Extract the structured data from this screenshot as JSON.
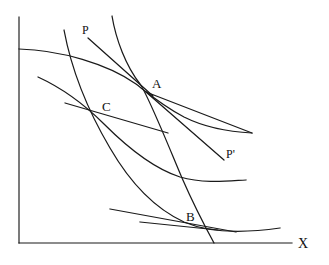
{
  "figure": {
    "type": "hand-drawn-economics-diagram",
    "title": "",
    "background_color": "#ffffff",
    "ink_color": "#1a1a1a",
    "width": 329,
    "height": 265
  },
  "axes": {
    "x_axis_label": "X",
    "y_axis_label": "",
    "x_axis": {
      "y": 243,
      "x_start": 19,
      "x_end": 292
    },
    "y_axis": {
      "x": 19,
      "y_start": 17,
      "y_end": 243
    }
  },
  "points": [
    {
      "name": "A",
      "label": "A",
      "x": 147,
      "y": 92,
      "label_x": 152,
      "label_y": 88
    },
    {
      "name": "C",
      "label": "C",
      "x": 100,
      "y": 114,
      "label_x": 102,
      "label_y": 111
    },
    {
      "name": "B",
      "label": "B",
      "x": 188,
      "y": 222,
      "label_x": 186,
      "label_y": 221
    }
  ],
  "curve_labels": [
    {
      "name": "P",
      "label": "P",
      "x": 82,
      "y": 34
    },
    {
      "name": "P-prime",
      "label": "P'",
      "x": 226,
      "y": 158
    }
  ],
  "curves": {
    "indifference_curve_upper": {
      "name": "indifference-curve-upper",
      "path": "M 19,49 C 60,50 108,64 136,84 C 144,90 160,104 184,117 C 206,128 232,132 252,133"
    },
    "indifference_curve_middle": {
      "name": "indifference-curve-middle",
      "path": "M 38,77 C 62,88 84,104 104,124 C 126,146 152,168 180,177 C 204,184 228,181 246,180"
    },
    "indifference_curve_lower": {
      "name": "indifference-curve-lower",
      "path": "M 64,30 C 70,62 84,104 110,148 C 132,186 158,210 184,222 C 214,235 252,232 280,228"
    },
    "price_offer_curve_through_A": {
      "name": "price-offer-curve-through-a",
      "path": "M 112,16 C 116,40 126,66 140,84 C 148,95 166,140 182,178 C 196,210 208,232 214,243"
    }
  },
  "budget_lines": {
    "budget_line_P_to_A": {
      "name": "budget-line-p-to-a",
      "path": "M 88,38 L 153,96"
    },
    "budget_line_A_to_Pprime": {
      "name": "budget-line-a-to-pprime",
      "path": "M 146,92 L 224,160"
    },
    "budget_line_through_C": {
      "name": "budget-line-through-c",
      "path": "M 65,103 L 168,133"
    },
    "budget_line_through_A_flat": {
      "name": "budget-line-through-a-flat",
      "path": "M 146,92 L 252,133"
    },
    "budget_line_through_B": {
      "name": "budget-line-through-b",
      "path": "M 110,209 L 236,232"
    },
    "budget_line_B_flat": {
      "name": "budget-line-b-flat",
      "path": "M 140,222 L 218,230"
    }
  }
}
